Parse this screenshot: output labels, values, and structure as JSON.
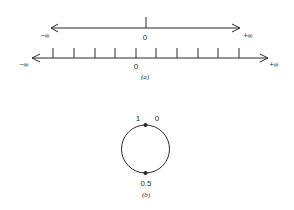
{
  "figure_a": {
    "caption": "(a)",
    "top_line": {
      "left_label": "−∞",
      "right_label": "+∞",
      "origin_label": "0"
    },
    "bottom_line": {
      "left_label": "−∞",
      "right_label": "+∞",
      "origin_label": "0",
      "tick_count": 10
    }
  },
  "figure_b": {
    "caption": "(b)",
    "top_left_label": "1",
    "top_right_label": "0",
    "bottom_label": "0.5"
  },
  "colors": {
    "ink": "#2a2a2a",
    "background": "#ffffff"
  }
}
